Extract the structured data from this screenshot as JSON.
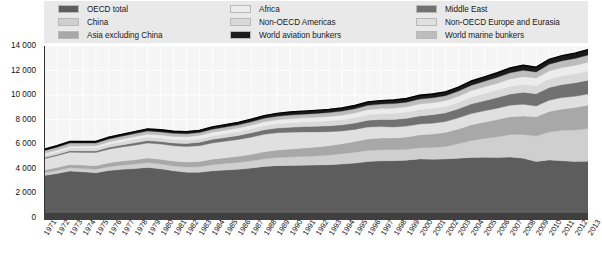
{
  "legend": {
    "columns": [
      {
        "items": [
          {
            "label": "OECD total",
            "color": "#5d5d5d",
            "icon": "legend-swatch"
          },
          {
            "label": "China",
            "color": "#cfcfcf",
            "icon": "legend-swatch"
          },
          {
            "label": "Asia excluding China",
            "color": "#a8a8a8",
            "icon": "legend-swatch"
          }
        ]
      },
      {
        "items": [
          {
            "label": "Africa",
            "color": "#ececec",
            "icon": "legend-swatch"
          },
          {
            "label": "Non-OECD Americas",
            "color": "#d9d9d9",
            "icon": "legend-swatch"
          },
          {
            "label": "World aviation bunkers",
            "color": "#1a1a1a",
            "icon": "legend-swatch"
          }
        ]
      },
      {
        "items": [
          {
            "label": "Middle East",
            "color": "#717171",
            "icon": "legend-swatch"
          },
          {
            "label": "Non-OECD Europe and Eurasia",
            "color": "#e0e0e0",
            "icon": "legend-swatch"
          },
          {
            "label": "World marine bunkers",
            "color": "#bdbdbd",
            "icon": "legend-swatch"
          }
        ]
      }
    ]
  },
  "chart_data": {
    "type": "area",
    "title": "",
    "subtitle": "",
    "xlabel": "",
    "ylabel": "",
    "stacked": true,
    "grid": true,
    "legend_position": "top",
    "xlim": [
      1971,
      2013
    ],
    "ylim": [
      0,
      14000
    ],
    "yticks": [
      0,
      2000,
      4000,
      6000,
      8000,
      10000,
      12000,
      14000
    ],
    "ytick_labels": [
      "0",
      "2 000",
      "4 000",
      "6 000",
      "8 000",
      "10 000",
      "12 000",
      "14 000"
    ],
    "x": [
      1971,
      1972,
      1973,
      1974,
      1975,
      1976,
      1977,
      1978,
      1979,
      1980,
      1981,
      1982,
      1983,
      1984,
      1985,
      1986,
      1987,
      1988,
      1989,
      1990,
      1991,
      1992,
      1993,
      1994,
      1995,
      1996,
      1997,
      1998,
      1999,
      2000,
      2001,
      2002,
      2003,
      2004,
      2005,
      2006,
      2007,
      2008,
      2009,
      2010,
      2011,
      2012,
      2013
    ],
    "xtick_labels": [
      "1971",
      "1972",
      "1973",
      "1974",
      "1975",
      "1976",
      "1977",
      "1978",
      "1979",
      "1980",
      "1981",
      "1982",
      "1983",
      "1984",
      "1985",
      "1986",
      "1987",
      "1988",
      "1989",
      "1990",
      "1991",
      "1992",
      "1993",
      "1994",
      "1995",
      "1996",
      "1997",
      "1998",
      "1999",
      "2000",
      "2001",
      "2002",
      "2003",
      "2004",
      "2005",
      "2006",
      "2007",
      "2008",
      "2009",
      "2010",
      "2011",
      "2012",
      "2013"
    ],
    "series": [
      {
        "name": "OECD total",
        "color": "#5d5d5d",
        "values": [
          3450,
          3620,
          3830,
          3760,
          3680,
          3870,
          3960,
          4020,
          4120,
          4000,
          3840,
          3730,
          3720,
          3840,
          3900,
          3960,
          4060,
          4200,
          4260,
          4280,
          4300,
          4320,
          4340,
          4400,
          4470,
          4600,
          4650,
          4670,
          4710,
          4810,
          4790,
          4810,
          4870,
          4930,
          4950,
          4930,
          4960,
          4870,
          4600,
          4730,
          4660,
          4600,
          4620
        ]
      },
      {
        "name": "China",
        "color": "#cfcfcf",
        "values": [
          220,
          240,
          260,
          270,
          290,
          310,
          340,
          370,
          390,
          400,
          400,
          420,
          450,
          490,
          530,
          560,
          590,
          630,
          660,
          680,
          700,
          730,
          780,
          830,
          880,
          900,
          900,
          890,
          880,
          900,
          940,
          1010,
          1180,
          1380,
          1530,
          1690,
          1830,
          1930,
          2070,
          2260,
          2480,
          2570,
          2670
        ]
      },
      {
        "name": "Asia excluding China",
        "color": "#a8a8a8",
        "values": [
          230,
          250,
          270,
          280,
          290,
          310,
          330,
          350,
          370,
          380,
          390,
          410,
          430,
          460,
          480,
          500,
          530,
          570,
          610,
          650,
          690,
          730,
          770,
          820,
          880,
          930,
          970,
          960,
          1010,
          1060,
          1100,
          1150,
          1200,
          1280,
          1330,
          1390,
          1460,
          1510,
          1570,
          1680,
          1740,
          1820,
          1900
        ]
      },
      {
        "name": "Non-OECD Europe and Eurasia",
        "color": "#e0e0e0",
        "values": [
          930,
          960,
          1000,
          1030,
          1070,
          1110,
          1150,
          1190,
          1220,
          1240,
          1250,
          1260,
          1290,
          1320,
          1340,
          1370,
          1400,
          1410,
          1400,
          1370,
          1320,
          1230,
          1140,
          1030,
          980,
          980,
          920,
          890,
          880,
          880,
          890,
          880,
          900,
          910,
          910,
          930,
          930,
          950,
          880,
          920,
          930,
          910,
          900
        ]
      },
      {
        "name": "Middle East",
        "color": "#717171",
        "values": [
          90,
          100,
          110,
          120,
          130,
          150,
          170,
          190,
          200,
          210,
          230,
          250,
          270,
          290,
          310,
          330,
          350,
          370,
          390,
          410,
          430,
          450,
          480,
          500,
          520,
          550,
          580,
          610,
          630,
          660,
          690,
          710,
          740,
          790,
          830,
          870,
          920,
          970,
          1000,
          1040,
          1060,
          1100,
          1130
        ]
      },
      {
        "name": "Non-OECD Americas",
        "color": "#d9d9d9",
        "values": [
          190,
          200,
          220,
          230,
          230,
          250,
          260,
          280,
          290,
          290,
          290,
          290,
          290,
          300,
          300,
          310,
          330,
          340,
          350,
          360,
          370,
          390,
          400,
          420,
          440,
          460,
          480,
          500,
          510,
          520,
          520,
          520,
          530,
          560,
          580,
          600,
          630,
          660,
          650,
          690,
          710,
          740,
          760
        ]
      },
      {
        "name": "Africa",
        "color": "#ececec",
        "values": [
          140,
          150,
          160,
          170,
          180,
          190,
          200,
          210,
          220,
          230,
          240,
          250,
          260,
          270,
          280,
          290,
          300,
          310,
          320,
          330,
          340,
          350,
          360,
          370,
          380,
          400,
          410,
          420,
          430,
          450,
          460,
          470,
          490,
          520,
          540,
          560,
          590,
          610,
          620,
          650,
          660,
          680,
          700
        ]
      },
      {
        "name": "World marine bunkers",
        "color": "#bdbdbd",
        "values": [
          230,
          240,
          250,
          240,
          230,
          240,
          250,
          260,
          270,
          260,
          250,
          250,
          250,
          260,
          260,
          260,
          270,
          280,
          290,
          300,
          300,
          310,
          320,
          330,
          340,
          350,
          360,
          370,
          380,
          400,
          400,
          410,
          420,
          440,
          460,
          480,
          510,
          530,
          500,
          540,
          560,
          570,
          580
        ]
      },
      {
        "name": "World aviation bunkers",
        "color": "#1a1a1a",
        "values": [
          110,
          120,
          130,
          130,
          130,
          140,
          150,
          160,
          170,
          170,
          170,
          170,
          175,
          185,
          195,
          205,
          215,
          225,
          235,
          245,
          245,
          250,
          250,
          255,
          265,
          275,
          285,
          290,
          300,
          315,
          305,
          310,
          315,
          340,
          355,
          375,
          395,
          400,
          385,
          400,
          415,
          425,
          435
        ]
      }
    ],
    "annotations": [
      {
        "text": "Total rises from about 5 600 in 1971 to about 13 400 in 2013"
      },
      {
        "text": "Visible dip in total around 2009"
      }
    ]
  }
}
